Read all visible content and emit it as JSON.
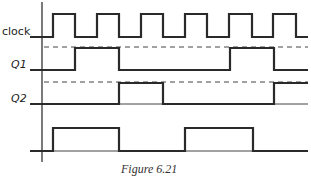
{
  "figure": {
    "caption": "Figure 6.21",
    "signals": [
      {
        "name": "clock",
        "label": "clock",
        "label_style": "sans"
      },
      {
        "name": "Q1",
        "label": "Q1",
        "label_style": "italic"
      },
      {
        "name": "Q2",
        "label": "Q2",
        "label_style": "italic"
      },
      {
        "name": "output",
        "label": "",
        "label_style": "none"
      }
    ],
    "colors": {
      "line": "#2a2a2a",
      "background": "#ffffff"
    }
  },
  "waveforms": {
    "x_start": 30,
    "x_end": 308,
    "clock": {
      "low_y": 37,
      "high_y": 14,
      "edges": [
        53,
        75,
        97,
        119,
        141,
        163,
        185,
        207,
        229,
        252,
        273,
        296
      ],
      "initial": "low"
    },
    "Q1": {
      "low_y": 70,
      "high_y": 48,
      "edges": [
        75,
        119,
        230,
        274
      ],
      "initial": "low",
      "dashed_ref_y": 47
    },
    "Q2": {
      "low_y": 104,
      "high_y": 83,
      "edges": [
        119,
        163,
        274
      ],
      "initial": "low",
      "dashed_ref_y": 82
    },
    "output": {
      "low_y": 151,
      "high_y": 128,
      "edges": [
        53,
        119,
        185,
        253
      ],
      "initial": "low"
    }
  },
  "axis": {
    "x": 42,
    "y_top": 2,
    "y_bottom": 162
  }
}
